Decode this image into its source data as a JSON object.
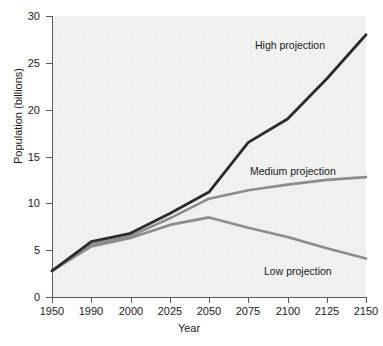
{
  "chart_data": {
    "type": "line",
    "title": "",
    "xlabel": "Year",
    "ylabel": "Population (billions)",
    "categories": [
      "1950",
      "1990",
      "2000",
      "2025",
      "2050",
      "2075",
      "2100",
      "2125",
      "2150"
    ],
    "xtick_labels": [
      "1950",
      "1990",
      "2000",
      "2025",
      "2050",
      "2075",
      "2100",
      "2125",
      "2150"
    ],
    "ytick_labels": [
      "0",
      "5",
      "10",
      "15",
      "20",
      "25",
      "30"
    ],
    "ytick_values": [
      0,
      5,
      10,
      15,
      20,
      25,
      30
    ],
    "ylim": [
      0,
      30
    ],
    "grid": false,
    "legend_position": "inline-annotations",
    "series": [
      {
        "name": "High projection",
        "color": "#2b2b2b",
        "values": [
          2.8,
          5.9,
          6.8,
          8.9,
          11.2,
          16.5,
          19.0,
          23.3,
          28.0
        ]
      },
      {
        "name": "Medium projection",
        "color": "#8c8c8c",
        "values": [
          2.8,
          5.6,
          6.5,
          8.4,
          10.5,
          11.4,
          12.0,
          12.5,
          12.8
        ]
      },
      {
        "name": "Low projection",
        "color": "#8c8c8c",
        "values": [
          2.8,
          5.4,
          6.3,
          7.7,
          8.5,
          7.4,
          6.4,
          5.2,
          4.1
        ]
      }
    ],
    "annotations": [
      {
        "label": "High projection",
        "series": "High projection"
      },
      {
        "label": "Medium projection",
        "series": "Medium projection"
      },
      {
        "label": "Low projection",
        "series": "Low projection"
      }
    ],
    "colors": {
      "high": "#2b2b2b",
      "medium": "#8c8c8c",
      "low": "#8c8c8c",
      "axis": "#5a5a5a",
      "plot_background": "#f2f2f0",
      "page_background": "#ffffff",
      "text": "#1a1a1a"
    }
  }
}
